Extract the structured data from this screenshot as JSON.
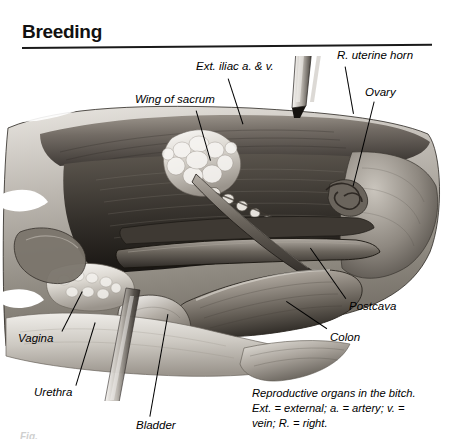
{
  "page": {
    "title": "Breeding",
    "background_color": "#ffffff",
    "ink_color": "#000000"
  },
  "figure": {
    "style": "grayscale-anatomical-airbrush-illustration",
    "palette": {
      "highlight": "#f2f0ec",
      "light_tissue": "#c8c4be",
      "mid_tissue": "#8f8a84",
      "dark_tissue": "#565049",
      "shadow": "#2c2823",
      "deep_shadow": "#161310"
    },
    "instruments": [
      {
        "name": "probe-top",
        "description": "metal probe entering from upper right toward uterine horn"
      },
      {
        "name": "probe-bottom-left",
        "description": "metal probe entering from lower left toward urethra"
      }
    ]
  },
  "labels": [
    {
      "id": "ext-iliac",
      "text": "Ext.  iliac  a. & v.",
      "x": 196,
      "y": 60,
      "leader": {
        "x": 228,
        "y": 78,
        "len": 48,
        "angle": 72
      }
    },
    {
      "id": "uterine-horn",
      "text": "R. uterine horn",
      "x": 337,
      "y": 49,
      "leader": {
        "x": 345,
        "y": 66,
        "len": 48,
        "angle": 80
      }
    },
    {
      "id": "ovary",
      "text": "Ovary",
      "x": 365,
      "y": 86,
      "leader": {
        "x": 374,
        "y": 101,
        "len": 87,
        "angle": 104
      }
    },
    {
      "id": "wing-sacrum",
      "text": "Wing of sacrum",
      "x": 135,
      "y": 93,
      "leader": {
        "x": 196,
        "y": 110,
        "len": 52,
        "angle": 74
      }
    },
    {
      "id": "postcava",
      "text": "Postcava",
      "x": 349,
      "y": 300,
      "leader": {
        "x": 346,
        "y": 298,
        "len": 62,
        "angle": 235
      }
    },
    {
      "id": "colon",
      "text": "Colon",
      "x": 330,
      "y": 331,
      "leader": {
        "x": 327,
        "y": 328,
        "len": 49,
        "angle": 214
      }
    },
    {
      "id": "vagina",
      "text": "Vagina",
      "x": 18,
      "y": 332,
      "leader": {
        "x": 62,
        "y": 331,
        "len": 45,
        "angle": -63
      }
    },
    {
      "id": "urethra",
      "text": "Urethra",
      "x": 34,
      "y": 386,
      "leader": {
        "x": 76,
        "y": 385,
        "len": 66,
        "angle": -73
      }
    },
    {
      "id": "bladder",
      "text": "Bladder",
      "x": 136,
      "y": 419,
      "leader": {
        "x": 150,
        "y": 416,
        "len": 104,
        "angle": -80
      }
    }
  ],
  "caption": {
    "line1": "Reproductive organs in the bitch.",
    "line2": "Ext.  =  external;  a.  =  artery;  v.  =",
    "line3": "vein;  R.  =  right."
  },
  "footer": {
    "clipped_text": "Fig."
  }
}
